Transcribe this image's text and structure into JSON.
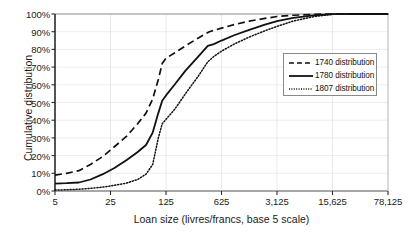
{
  "chart_data": {
    "type": "line",
    "title": "",
    "xlabel": "Loan size (livres/francs, base 5 scale)",
    "ylabel": "Cumulative distribution",
    "x_scale": "log5",
    "xticks": [
      5,
      25,
      125,
      625,
      3125,
      15625,
      78125
    ],
    "xtick_labels": [
      "5",
      "25",
      "125",
      "625",
      "3,125",
      "15,625",
      "78,125"
    ],
    "xlim": [
      5,
      78125
    ],
    "yticks": [
      0,
      10,
      20,
      30,
      40,
      50,
      60,
      70,
      80,
      90,
      100
    ],
    "ytick_labels": [
      "0%",
      "10%",
      "20%",
      "30%",
      "40%",
      "50%",
      "60%",
      "70%",
      "80%",
      "90%",
      "100%"
    ],
    "ylim": [
      0,
      100
    ],
    "grid": true,
    "legend_position": "right",
    "series": [
      {
        "name": "1740 distribution",
        "style": "dashed",
        "color": "#111111",
        "points": [
          [
            5,
            9.0
          ],
          [
            7,
            10.0
          ],
          [
            10,
            11.5
          ],
          [
            14,
            15.0
          ],
          [
            20,
            19.5
          ],
          [
            28,
            25.0
          ],
          [
            40,
            31.0
          ],
          [
            55,
            38.0
          ],
          [
            70,
            44.0
          ],
          [
            85,
            52.0
          ],
          [
            100,
            63.0
          ],
          [
            112,
            72.0
          ],
          [
            125,
            75.0
          ],
          [
            160,
            78.0
          ],
          [
            220,
            82.0
          ],
          [
            320,
            86.5
          ],
          [
            440,
            90.0
          ],
          [
            625,
            92.0
          ],
          [
            900,
            94.0
          ],
          [
            1400,
            96.0
          ],
          [
            2200,
            97.5
          ],
          [
            3125,
            98.6
          ],
          [
            5000,
            99.3
          ],
          [
            9000,
            99.8
          ],
          [
            15625,
            100.0
          ],
          [
            30000,
            100.0
          ],
          [
            78125,
            100.0
          ]
        ]
      },
      {
        "name": "1780 distribution",
        "style": "solid",
        "color": "#111111",
        "points": [
          [
            5,
            4.2
          ],
          [
            7,
            4.4
          ],
          [
            10,
            4.8
          ],
          [
            14,
            6.5
          ],
          [
            20,
            9.5
          ],
          [
            28,
            13.0
          ],
          [
            40,
            17.5
          ],
          [
            55,
            22.0
          ],
          [
            70,
            26.0
          ],
          [
            85,
            33.0
          ],
          [
            100,
            44.0
          ],
          [
            112,
            51.0
          ],
          [
            125,
            54.0
          ],
          [
            160,
            60.0
          ],
          [
            220,
            68.0
          ],
          [
            320,
            76.0
          ],
          [
            420,
            82.0
          ],
          [
            500,
            83.0
          ],
          [
            625,
            85.0
          ],
          [
            900,
            88.0
          ],
          [
            1400,
            91.0
          ],
          [
            2200,
            94.0
          ],
          [
            3125,
            96.0
          ],
          [
            5000,
            97.8
          ],
          [
            9000,
            99.2
          ],
          [
            15625,
            99.9
          ],
          [
            30000,
            100.0
          ],
          [
            78125,
            100.0
          ]
        ]
      },
      {
        "name": "1807 distribution",
        "style": "dotted",
        "color": "#111111",
        "points": [
          [
            5,
            0.5
          ],
          [
            7,
            0.7
          ],
          [
            10,
            1.0
          ],
          [
            14,
            1.5
          ],
          [
            20,
            2.2
          ],
          [
            28,
            3.2
          ],
          [
            40,
            4.5
          ],
          [
            55,
            6.5
          ],
          [
            70,
            9.5
          ],
          [
            85,
            15.0
          ],
          [
            100,
            30.0
          ],
          [
            112,
            38.0
          ],
          [
            125,
            40.5
          ],
          [
            160,
            46.0
          ],
          [
            220,
            55.0
          ],
          [
            320,
            65.0
          ],
          [
            420,
            73.0
          ],
          [
            500,
            76.0
          ],
          [
            625,
            79.0
          ],
          [
            900,
            83.0
          ],
          [
            1400,
            87.0
          ],
          [
            2200,
            90.5
          ],
          [
            3125,
            93.0
          ],
          [
            5000,
            96.0
          ],
          [
            9000,
            98.5
          ],
          [
            15625,
            99.8
          ],
          [
            30000,
            100.0
          ],
          [
            78125,
            100.0
          ]
        ]
      }
    ]
  },
  "axes": {
    "y_title": "Cumulative distribution",
    "x_title": "Loan size (livres/francs, base 5 scale)"
  },
  "legend": {
    "items": [
      {
        "label": "1740 distribution",
        "style": "dashed"
      },
      {
        "label": "1780 distribution",
        "style": "solid"
      },
      {
        "label": "1807 distribution",
        "style": "dotted"
      }
    ]
  }
}
